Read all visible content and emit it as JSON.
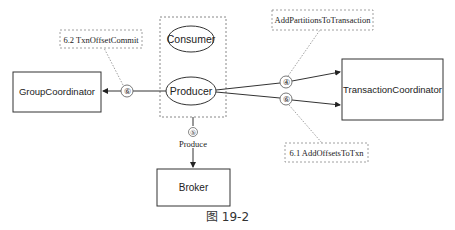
{
  "diagram": {
    "client_group": {
      "consumer": "Consumer",
      "producer": "Producer"
    },
    "nodes": {
      "group_coordinator": "GroupCoordinator",
      "transaction_coordinator": "TransactionCoordinator",
      "broker": "Broker"
    },
    "edges": {
      "producer_to_group_coordinator": {
        "step": "⑥",
        "label": "6.2 TxnOffsetCommit"
      },
      "producer_to_txn_coordinator_add_partitions": {
        "step": "④",
        "label": "AddPartitionsToTransaction"
      },
      "producer_to_txn_coordinator_add_offsets": {
        "step": "⑥",
        "label": "6.1 AddOffsetsToTxn"
      },
      "producer_to_broker": {
        "step": "⑤",
        "label": "Produce"
      }
    },
    "colors": {
      "line": "#333333",
      "dashed": "#888888",
      "text": "#222222"
    }
  },
  "caption": "图 19-2"
}
